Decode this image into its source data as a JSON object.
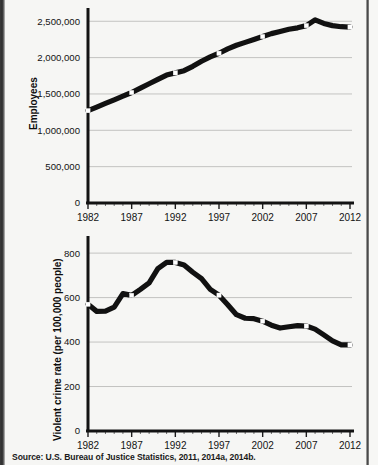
{
  "figure": {
    "source_note": "Source: U.S. Bureau of Justice Statistics, 2011, 2014a, 2014b."
  },
  "chart_data": [
    {
      "id": "employees-chart",
      "type": "line",
      "title": "",
      "xlabel": "",
      "ylabel": "Employees",
      "xlim": [
        1982,
        2012
      ],
      "ylim": [
        0,
        2600000
      ],
      "grid": true,
      "legend": "none",
      "x_ticks": [
        1982,
        1987,
        1992,
        1997,
        2002,
        2007,
        2012
      ],
      "x_tick_labels": [
        "1982",
        "1987",
        "1992",
        "1997",
        "2002",
        "2007",
        "2012"
      ],
      "y_ticks": [
        0,
        500000,
        1000000,
        1500000,
        2000000,
        2500000
      ],
      "y_tick_labels": [
        "0",
        "500,000",
        "1,000,000",
        "1,500,000",
        "2,000,000",
        "2,500,000"
      ],
      "marker_years": [
        1982,
        1987,
        1992,
        1997,
        2002,
        2007,
        2012
      ],
      "x": [
        1982,
        1983,
        1984,
        1985,
        1986,
        1987,
        1988,
        1989,
        1990,
        1991,
        1992,
        1993,
        1994,
        1995,
        1996,
        1997,
        1998,
        1999,
        2000,
        2001,
        2002,
        2003,
        2004,
        2005,
        2006,
        2007,
        2008,
        2009,
        2010,
        2011,
        2012
      ],
      "values": [
        1270000,
        1320000,
        1370000,
        1420000,
        1470000,
        1520000,
        1580000,
        1640000,
        1700000,
        1760000,
        1790000,
        1820000,
        1880000,
        1950000,
        2010000,
        2060000,
        2120000,
        2170000,
        2210000,
        2250000,
        2290000,
        2330000,
        2360000,
        2390000,
        2410000,
        2440000,
        2520000,
        2470000,
        2440000,
        2425000,
        2420000
      ]
    },
    {
      "id": "violent-crime-chart",
      "type": "line",
      "title": "",
      "xlabel": "",
      "ylabel": "Violent crime rate (per 100,000 people)",
      "xlim": [
        1982,
        2012
      ],
      "ylim": [
        0,
        850
      ],
      "grid": true,
      "legend": "none",
      "x_ticks": [
        1982,
        1987,
        1992,
        1997,
        2002,
        2007,
        2012
      ],
      "x_tick_labels": [
        "1982",
        "1987",
        "1992",
        "1997",
        "2002",
        "2007",
        "2012"
      ],
      "y_ticks": [
        0,
        200,
        400,
        600,
        800
      ],
      "y_tick_labels": [
        "0",
        "200",
        "400",
        "600",
        "800"
      ],
      "marker_years": [
        1982,
        1987,
        1992,
        1997,
        2002,
        2007,
        2012
      ],
      "x": [
        1982,
        1983,
        1984,
        1985,
        1986,
        1987,
        1988,
        1989,
        1990,
        1991,
        1992,
        1993,
        1994,
        1995,
        1996,
        1997,
        1998,
        1999,
        2000,
        2001,
        2002,
        2003,
        2004,
        2005,
        2006,
        2007,
        2008,
        2009,
        2010,
        2011,
        2012
      ],
      "values": [
        570,
        538,
        539,
        557,
        618,
        610,
        637,
        666,
        730,
        758,
        758,
        747,
        714,
        685,
        637,
        611,
        568,
        523,
        507,
        505,
        494,
        476,
        463,
        469,
        474,
        472,
        458,
        432,
        405,
        387,
        387
      ]
    }
  ]
}
